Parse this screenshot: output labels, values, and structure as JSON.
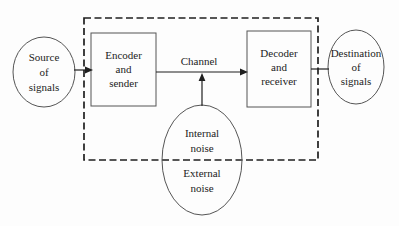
{
  "diagram": {
    "nodes": {
      "source": {
        "label": "Source\nof\nsignals",
        "shape": "ellipse"
      },
      "encoder": {
        "label": "Encoder\nand\nsender",
        "shape": "rect"
      },
      "channel": {
        "label": "Channel",
        "shape": "edge-label"
      },
      "decoder": {
        "label": "Decoder\nand\nreceiver",
        "shape": "rect"
      },
      "destination": {
        "label": "Destination\nof\nsignals",
        "shape": "ellipse"
      },
      "internal_noise": {
        "label": "Internal\nnoise",
        "shape": "ellipse-upper"
      },
      "external_noise": {
        "label": "External\nnoise",
        "shape": "ellipse-lower"
      }
    },
    "edges": [
      {
        "from": "source",
        "to": "encoder",
        "arrow": true
      },
      {
        "from": "encoder",
        "to": "decoder",
        "arrow": true,
        "label": "Channel"
      },
      {
        "from": "decoder",
        "to": "destination",
        "arrow": false
      },
      {
        "from": "noise",
        "to": "channel",
        "arrow": true
      }
    ],
    "boundary": {
      "style": "dashed",
      "encloses": "encoder, channel, decoder, internal noise"
    },
    "colors": {
      "background": "#fdfdfd",
      "line": "#1f1f1f",
      "shape_outline": "#555555",
      "text": "#1c1c1c"
    }
  }
}
